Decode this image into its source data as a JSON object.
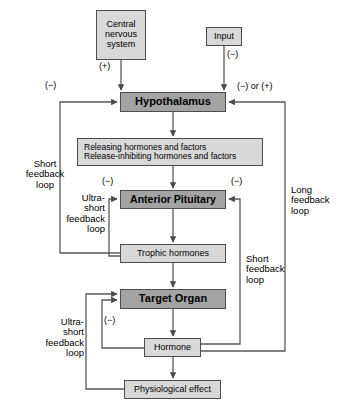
{
  "diagram": {
    "colors": {
      "box_dark": "#a3a3a3",
      "box_light": "#d8d8d8",
      "border": "#4d4d4d",
      "line": "#5a5a5a",
      "background": "#ffffff",
      "text": "#000000"
    },
    "nodes": [
      {
        "id": "central-nervous-system",
        "label": "Central\nnervous\nsystem",
        "style": "light",
        "font_size": 9,
        "x": 96,
        "y": 10,
        "w": 50,
        "h": 50
      },
      {
        "id": "input",
        "label": "Input",
        "style": "light",
        "font_size": 9,
        "x": 206,
        "y": 27,
        "w": 36,
        "h": 19
      },
      {
        "id": "hypothalamus",
        "label": "Hypothalamus",
        "style": "dark",
        "font_size": 11,
        "x": 120,
        "y": 92,
        "w": 106,
        "h": 20
      },
      {
        "id": "releasing-hormones",
        "label": "Releasing hormones and factors\nRelease-inhibiting hormones and factors",
        "style": "light",
        "font_size": 8.5,
        "x": 77,
        "y": 138,
        "w": 186,
        "h": 28
      },
      {
        "id": "anterior-pituitary",
        "label": "Anterior Pituitary",
        "style": "dark",
        "font_size": 10.5,
        "x": 120,
        "y": 190,
        "w": 106,
        "h": 19
      },
      {
        "id": "trophic-hormones",
        "label": "Trophic hormones",
        "style": "light",
        "font_size": 9,
        "x": 120,
        "y": 244,
        "w": 106,
        "h": 19
      },
      {
        "id": "target-organ",
        "label": "Target Organ",
        "style": "dark",
        "font_size": 11,
        "x": 120,
        "y": 289,
        "w": 106,
        "h": 20
      },
      {
        "id": "hormone",
        "label": "Hormone",
        "style": "light",
        "font_size": 9,
        "x": 144,
        "y": 338,
        "w": 57,
        "h": 19
      },
      {
        "id": "physiological-effect",
        "label": "Physiological effect",
        "style": "light",
        "font_size": 9,
        "x": 124,
        "y": 380,
        "w": 97,
        "h": 19
      }
    ],
    "signs": [
      {
        "id": "sign-cns-plus",
        "text": "(+)",
        "x": 99,
        "y": 63,
        "align": "left"
      },
      {
        "id": "sign-input-minus",
        "text": "(−)",
        "x": 226,
        "y": 50,
        "align": "left"
      },
      {
        "id": "sign-long-loop-minus",
        "text": "(−)",
        "x": 45,
        "y": 82,
        "align": "left"
      },
      {
        "id": "sign-right-minus-plus",
        "text": "(−) or (+)",
        "x": 238,
        "y": 83,
        "align": "left"
      },
      {
        "id": "sign-ap-left-minus",
        "text": "(−)",
        "x": 103,
        "y": 178,
        "align": "left"
      },
      {
        "id": "sign-ap-right-minus",
        "text": "(−)",
        "x": 231,
        "y": 178,
        "align": "left"
      },
      {
        "id": "sign-target-minus",
        "text": "(−)",
        "x": 104,
        "y": 317,
        "align": "left"
      }
    ],
    "loop_labels": [
      {
        "id": "short-feedback-loop-left",
        "text": "Short\nfeedback\nloop",
        "x": 22,
        "y": 160,
        "w": 48,
        "align": "center"
      },
      {
        "id": "ultra-short-feedback-loop-upper",
        "text": "Ultra-\nshort\nfeedback\nloop",
        "x": 60,
        "y": 194,
        "w": 46,
        "align": "right"
      },
      {
        "id": "long-feedback-loop-right",
        "text": "Long\nfeedback\nloop",
        "x": 290,
        "y": 186,
        "w": 46,
        "align": "left"
      },
      {
        "id": "short-feedback-loop-right",
        "text": "Short\nfeedback\nloop",
        "x": 245,
        "y": 255,
        "w": 46,
        "align": "left"
      },
      {
        "id": "ultra-short-feedback-loop-lower",
        "text": "Ultra-\nshort\nfeedback\nloop",
        "x": 38,
        "y": 318,
        "w": 48,
        "align": "right"
      }
    ],
    "connections": [
      {
        "id": "cns-to-hypothalamus",
        "from": "central-nervous-system",
        "to": "hypothalamus",
        "sign": "(+)"
      },
      {
        "id": "input-to-hypothalamus",
        "from": "input",
        "to": "hypothalamus",
        "sign": "(−)"
      },
      {
        "id": "hypothalamus-to-releasing",
        "from": "hypothalamus",
        "to": "releasing-hormones",
        "sign": ""
      },
      {
        "id": "releasing-to-anterior-pituitary",
        "from": "releasing-hormones",
        "to": "anterior-pituitary",
        "sign": ""
      },
      {
        "id": "anterior-pituitary-to-trophic",
        "from": "anterior-pituitary",
        "to": "trophic-hormones",
        "sign": ""
      },
      {
        "id": "trophic-to-target-organ",
        "from": "trophic-hormones",
        "to": "target-organ",
        "sign": ""
      },
      {
        "id": "target-organ-to-hormone",
        "from": "target-organ",
        "to": "hormone",
        "sign": ""
      },
      {
        "id": "hormone-to-physiological-effect",
        "from": "hormone",
        "to": "physiological-effect",
        "sign": ""
      },
      {
        "id": "long-feedback-hormone-to-hypothalamus",
        "from": "hormone",
        "to": "hypothalamus",
        "sign": "(−) or (+)"
      },
      {
        "id": "short-feedback-trophic-to-hypothalamus",
        "from": "trophic-hormones",
        "to": "hypothalamus",
        "sign": "(−)"
      },
      {
        "id": "short-feedback-hormone-to-anterior-pituitary",
        "from": "hormone",
        "to": "anterior-pituitary",
        "sign": "(−)"
      },
      {
        "id": "ultra-short-trophic-to-anterior-pituitary",
        "from": "trophic-hormones",
        "to": "anterior-pituitary",
        "sign": "(−)"
      },
      {
        "id": "ultra-short-hormone-to-target-organ",
        "from": "hormone",
        "to": "target-organ",
        "sign": "(−)"
      },
      {
        "id": "ultra-short-physiological-to-target-organ",
        "from": "physiological-effect",
        "to": "target-organ",
        "sign": ""
      }
    ]
  }
}
